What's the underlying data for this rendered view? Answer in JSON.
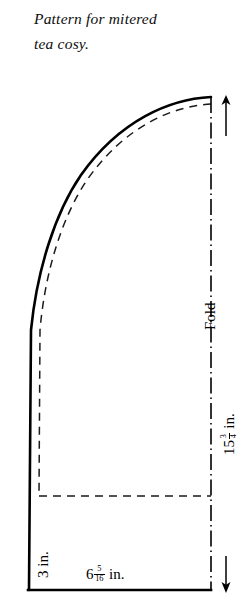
{
  "caption": {
    "line1": "Pattern for mitered",
    "line2": "tea cosy."
  },
  "diagram": {
    "labels": {
      "fold": "Fold",
      "height_whole": "15",
      "height_frac_num": "3",
      "height_frac_den": "4",
      "height_unit": "in.",
      "height_full": "15¾ in.",
      "depth": "3 in.",
      "width_whole": "6",
      "width_frac_num": "5",
      "width_frac_den": "16",
      "width_unit": "in.",
      "width_full": "6 5/16 in."
    },
    "colors": {
      "ink": "#000000",
      "paper": "#ffffff"
    },
    "lines": {
      "outline_style": "solid",
      "seam_style": "dashed",
      "fold_style": "dash-dot"
    },
    "arrows": {
      "top": "arrow-up",
      "bottom": "arrow-down"
    }
  }
}
